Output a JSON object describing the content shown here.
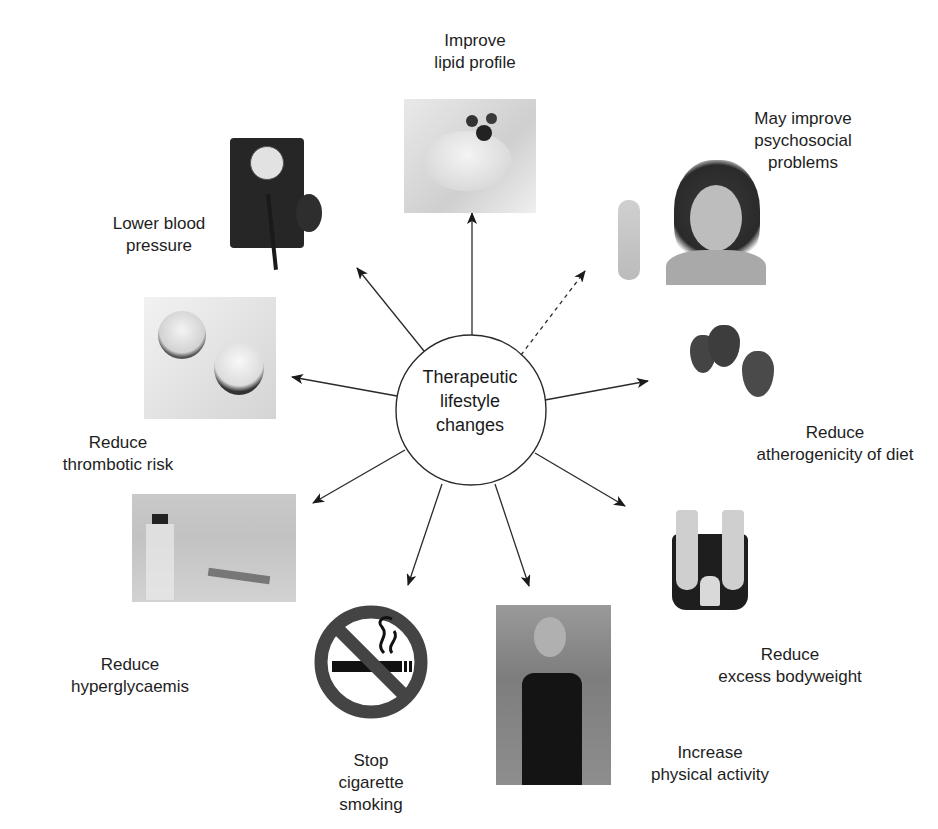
{
  "diagram": {
    "center": {
      "label": "Therapeutic\nlifestyle\nchanges"
    },
    "outcomes": [
      {
        "id": "lipid",
        "label": "Improve\nlipid profile",
        "image": "dessert-with-berries",
        "arrow": "solid"
      },
      {
        "id": "psychosocial",
        "label": "May improve\npsychosocial\nproblems",
        "image": "smiling-woman-ok-sign",
        "arrow": "dashed"
      },
      {
        "id": "atherogenicity",
        "label": "Reduce\natherogenicity of diet",
        "image": "strawberries",
        "arrow": "solid"
      },
      {
        "id": "bodyweight",
        "label": "Reduce\nexcess bodyweight",
        "image": "feet-on-scale",
        "arrow": "solid"
      },
      {
        "id": "physical-activity",
        "label": "Increase\nphysical activity",
        "image": "woman-jogging",
        "arrow": "solid"
      },
      {
        "id": "smoking",
        "label": "Stop\ncigarette\nsmoking",
        "image": "no-smoking-sign",
        "arrow": "solid"
      },
      {
        "id": "hyperglycaemia",
        "label": "Reduce\nhyperglycaemis",
        "image": "insulin-vial-and-pen",
        "arrow": "solid"
      },
      {
        "id": "thrombotic",
        "label": "Reduce\nthrombotic risk",
        "image": "tablets",
        "arrow": "solid"
      },
      {
        "id": "blood-pressure",
        "label": "Lower blood\npressure",
        "image": "sphygmomanometer",
        "arrow": "solid"
      }
    ]
  }
}
